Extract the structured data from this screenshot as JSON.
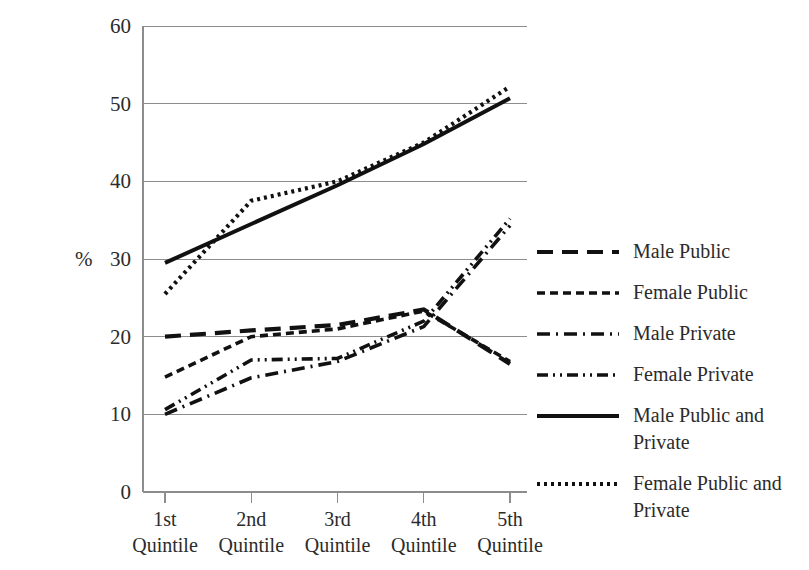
{
  "chart_data": {
    "type": "line",
    "title": "",
    "xlabel": "",
    "ylabel": "%",
    "ylim": [
      0,
      60
    ],
    "yticks": [
      0,
      10,
      20,
      30,
      40,
      50,
      60
    ],
    "grid": true,
    "legend_position": "right",
    "categories": [
      "1st Quintile",
      "2nd Quintile",
      "3rd Quintile",
      "4th Quintile",
      "5th Quintile"
    ],
    "category_lines": [
      [
        "1st",
        "Quintile"
      ],
      [
        "2nd",
        "Quintile"
      ],
      [
        "3rd",
        "Quintile"
      ],
      [
        "4th",
        "Quintile"
      ],
      [
        "5th",
        "Quintile"
      ]
    ],
    "series": [
      {
        "name": "Male Public",
        "style": "long-dash",
        "dasharray": "16,9",
        "width": 4.2,
        "values": [
          20.0,
          20.8,
          21.5,
          23.5,
          16.5
        ]
      },
      {
        "name": "Female Public",
        "style": "short-dash",
        "dasharray": "8,5",
        "width": 3.6,
        "values": [
          14.8,
          20.0,
          21.0,
          23.3,
          16.8
        ]
      },
      {
        "name": "Male Private",
        "style": "dash-dot",
        "dasharray": "13,6,2,6",
        "width": 3.6,
        "values": [
          10.0,
          14.7,
          16.8,
          21.3,
          34.3
        ]
      },
      {
        "name": "Female Private",
        "style": "dash-dot-dot",
        "dasharray": "11,5,2,5,2,5",
        "width": 3.6,
        "values": [
          10.6,
          17.0,
          17.2,
          22.0,
          35.2
        ]
      },
      {
        "name": "Male Public and Private",
        "style": "solid",
        "dasharray": "",
        "width": 4.0,
        "values": [
          29.5,
          34.5,
          39.5,
          44.8,
          50.7
        ]
      },
      {
        "name": "Female Public and Private",
        "style": "dotted",
        "dasharray": "3,4",
        "width": 4.2,
        "values": [
          25.5,
          37.5,
          40.0,
          45.0,
          52.2
        ]
      }
    ]
  },
  "axis": {
    "y_unit_label": "%",
    "tick_labels": [
      "60",
      "50",
      "40",
      "30",
      "20",
      "10",
      "0"
    ]
  },
  "legend": {
    "items": [
      {
        "label": "Male Public",
        "line1": "Male Public",
        "line2": ""
      },
      {
        "label": "Female Public",
        "line1": "Female Public",
        "line2": ""
      },
      {
        "label": "Male Private",
        "line1": "Male Private",
        "line2": ""
      },
      {
        "label": "Female Private",
        "line1": "Female Private",
        "line2": ""
      },
      {
        "label": "Male Public and Private",
        "line1": "Male Public and",
        "line2": "Private"
      },
      {
        "label": "Female Public and Private",
        "line1": "Female Public and",
        "line2": "Private"
      }
    ]
  },
  "colors": {
    "ink": "#111111",
    "grid": "#8d8d8d",
    "text": "#2b2b2b",
    "background": "#ffffff"
  }
}
